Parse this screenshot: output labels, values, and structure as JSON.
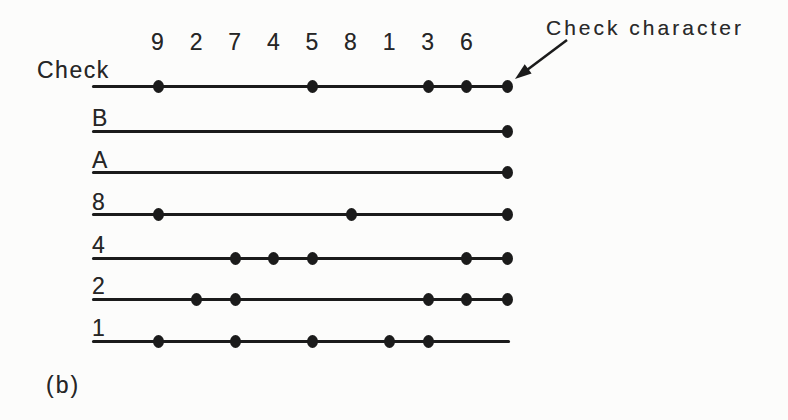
{
  "figure": {
    "type": "parity-check-code-diagram",
    "caption": "(b)",
    "annotation_label": "Check character",
    "column_labels": [
      "9",
      "2",
      "7",
      "4",
      "5",
      "8",
      "1",
      "3",
      "6"
    ],
    "rows": [
      {
        "label": "Check",
        "dots_at_columns": [
          "9",
          "5",
          "3",
          "6"
        ],
        "check_dot": true
      },
      {
        "label": "B",
        "dots_at_columns": [],
        "check_dot": true
      },
      {
        "label": "A",
        "dots_at_columns": [],
        "check_dot": true
      },
      {
        "label": "8",
        "dots_at_columns": [
          "9",
          "8"
        ],
        "check_dot": true
      },
      {
        "label": "4",
        "dots_at_columns": [
          "7",
          "4",
          "5",
          "6"
        ],
        "check_dot": true
      },
      {
        "label": "2",
        "dots_at_columns": [
          "2",
          "7",
          "3",
          "6"
        ],
        "check_dot": true
      },
      {
        "label": "1",
        "dots_at_columns": [
          "9",
          "7",
          "5",
          "1",
          "3"
        ],
        "check_dot": false
      }
    ],
    "colors": {
      "ink": "#1b1b1b",
      "background": "#fcfcfb"
    }
  }
}
